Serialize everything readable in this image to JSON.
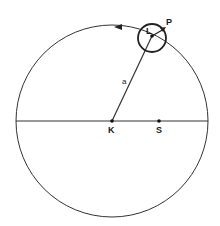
{
  "diagram": {
    "type": "orbit-epicycle",
    "labels": {
      "center": "K",
      "focus": "S",
      "moving_point": "L",
      "satellite": "P",
      "radius": "a"
    },
    "colors": {
      "line": "#333333",
      "background": "#ffffff"
    }
  }
}
